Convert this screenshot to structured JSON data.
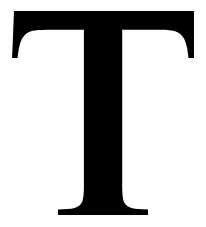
{
  "image": {
    "kind": "letterform-glyph",
    "character": "T",
    "character_name": "latin-capital-letter-t",
    "style": "serif",
    "typeface_class": "transitional-serif",
    "case": "uppercase",
    "canvas_width": 206,
    "canvas_height": 227,
    "background_color": "#ffffff",
    "glyph_color": "#000000"
  },
  "metrics": {
    "cap_top_y": 11,
    "baseline_y": 215,
    "bar_left_x": 14,
    "bar_right_x": 194,
    "bar_bottom_y": 30,
    "stem_left_x": 85,
    "stem_right_x": 122,
    "spur_bottom_y": 58,
    "foot_left_x": 58,
    "foot_right_x": 148,
    "foot_top_y": 183
  },
  "geometry": {
    "glyph_path": "M 14 11 L 194 11 L 194 58 L 188.5 58 C 187.6 48.5 186.0 41.8 183.6 37.9 C 181.2 34.0 177.4 31.6 172.2 30.6 C 168.9 30.0 163.0 29.7 154.4 29.7 L 122.2 29.7 L 122.2 186.0 C 122.2 194.4 122.9 199.9 124.2 202.6 C 125.6 205.3 128.3 207.2 132.4 208.2 C 135.3 208.9 140.5 209.3 148.0 209.4 L 148.0 215.0 L 58.0 215.0 L 58.0 209.4 C 65.6 209.3 70.8 208.9 73.7 208.2 C 77.8 207.2 80.5 205.3 81.9 202.6 C 83.2 199.9 83.9 194.4 83.9 186.0 L 83.9 29.7 L 51.7 29.7 C 43.1 29.7 37.2 30.0 33.9 30.6 C 28.7 31.6 24.9 34.0 22.5 37.9 C 20.1 41.8 18.5 48.5 17.6 58 L 12.1 58 Z",
    "view_box": "0 0 206 227",
    "fill_rule": "nonzero"
  },
  "accessibility": {
    "alt_text": "T",
    "role_label": "letter-t-glyph"
  }
}
